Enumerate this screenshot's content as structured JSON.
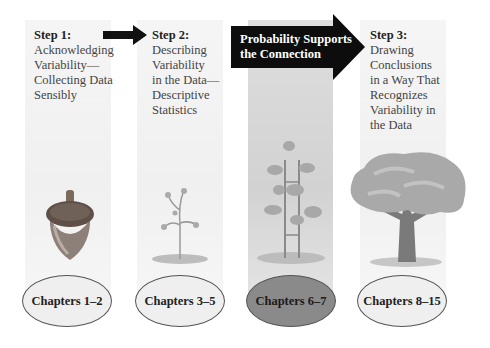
{
  "steps": [
    {
      "heading": "Step 1:",
      "body": "Acknowledging\nVariability—\nCollecting Data\nSensibly",
      "chapters": "Chapters 1–2",
      "illustration": "acorn-icon"
    },
    {
      "heading": "Step 2:",
      "body": "Describing\nVariability\nin the Data—\nDescriptive\nStatistics",
      "chapters": "Chapters 3–5",
      "illustration": "seedling-icon"
    },
    {
      "heading": "",
      "body": "",
      "chapters": "Chapters 6–7",
      "illustration": "sapling-icon"
    },
    {
      "heading": "Step 3:",
      "body": "Drawing\nConclusions\nin a Way That\nRecognizes\nVariability in\nthe Data",
      "chapters": "Chapters 8–15",
      "illustration": "oak-tree-icon"
    }
  ],
  "connector": {
    "label": "Probability Supports\nthe Connection"
  },
  "colors": {
    "panel_light": "#f3f3f3",
    "panel_dark": "#d6d6d6",
    "arrow": "#111111",
    "ellipse_dark": "#8a8a8a",
    "ellipse_light": "#efefef"
  }
}
